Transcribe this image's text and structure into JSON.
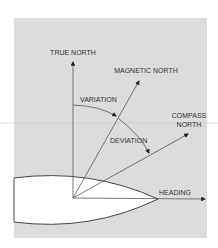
{
  "diagram": {
    "labels": {
      "true_north": "TRUE NORTH",
      "magnetic_north": "MAGNETIC NORTH",
      "compass_line1": "COMPASS",
      "compass_line2": "NORTH",
      "variation": "VARIATION",
      "deviation": "DEVIATION",
      "heading": "HEADING"
    },
    "colors": {
      "panel": "#dcdcdc",
      "line": "#555555",
      "boat": "#ffffff",
      "text": "#333333"
    }
  }
}
